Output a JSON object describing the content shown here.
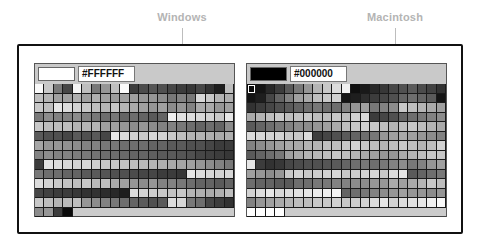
{
  "labels": {
    "left": "Windows",
    "right": "Macintosh"
  },
  "panels": [
    {
      "id": "windows",
      "preview_color": "#FFFFFF",
      "hex_value": "#FFFFFF",
      "rows": [
        [
          250,
          200,
          120,
          70,
          245,
          190,
          120,
          150,
          190,
          250,
          60,
          75,
          85,
          80,
          70,
          60,
          55,
          70,
          50,
          30,
          190
        ],
        [
          190,
          180,
          160,
          160,
          175,
          160,
          175,
          160,
          155,
          160,
          160,
          150,
          150,
          140,
          120,
          130,
          120,
          215,
          200,
          180,
          175
        ],
        [
          200,
          190,
          230,
          220,
          210,
          200,
          190,
          180,
          200,
          180,
          170,
          160,
          150,
          160,
          140,
          150,
          130,
          170,
          170,
          150,
          160
        ],
        [
          120,
          140,
          130,
          130,
          140,
          130,
          120,
          110,
          120,
          100,
          110,
          100,
          90,
          100,
          240,
          225,
          220,
          215,
          210,
          200,
          230
        ],
        [
          200,
          190,
          190,
          190,
          180,
          180,
          180,
          160,
          160,
          150,
          140,
          150,
          140,
          130,
          130,
          120,
          110,
          100,
          110,
          100,
          140
        ],
        [
          90,
          80,
          80,
          70,
          90,
          80,
          90,
          70,
          230,
          220,
          210,
          200,
          215,
          210,
          200,
          190,
          180,
          180,
          175,
          170,
          175
        ],
        [
          165,
          150,
          150,
          145,
          140,
          130,
          130,
          120,
          120,
          110,
          110,
          110,
          100,
          100,
          90,
          90,
          80,
          80,
          70,
          60,
          60
        ],
        [
          130,
          140,
          130,
          130,
          125,
          120,
          115,
          110,
          110,
          105,
          100,
          100,
          95,
          90,
          90,
          85,
          80,
          70,
          65,
          60,
          55
        ],
        [
          60,
          225,
          220,
          215,
          210,
          215,
          205,
          200,
          200,
          195,
          190,
          185,
          180,
          175,
          170,
          165,
          160,
          150,
          140,
          130,
          120
        ],
        [
          120,
          110,
          110,
          100,
          100,
          90,
          90,
          85,
          80,
          80,
          75,
          70,
          70,
          60,
          60,
          55,
          230,
          220,
          215,
          210,
          215
        ],
        [
          220,
          210,
          200,
          195,
          190,
          200,
          185,
          190,
          170,
          160,
          150,
          140,
          150,
          130,
          130,
          120,
          110,
          100,
          100,
          90,
          100
        ],
        [
          70,
          65,
          60,
          60,
          55,
          50,
          50,
          45,
          40,
          30,
          220,
          210,
          205,
          200,
          195,
          200,
          180,
          175,
          170,
          175,
          190
        ],
        [
          200,
          190,
          180,
          185,
          190,
          150,
          140,
          130,
          120,
          110,
          100,
          90,
          80,
          90,
          220,
          215,
          120,
          110,
          70,
          60,
          50
        ],
        [
          140,
          150,
          60,
          10
        ]
      ]
    },
    {
      "id": "macintosh",
      "preview_color": "#000000",
      "hex_value": "#000000",
      "rows": [
        [
          10,
          20,
          40,
          60,
          90,
          120,
          150,
          180,
          200,
          220,
          240,
          15,
          25,
          40,
          55,
          70,
          80,
          90,
          75,
          65,
          50
        ],
        [
          20,
          30,
          70,
          100,
          130,
          160,
          170,
          190,
          200,
          210,
          20,
          30,
          45,
          60,
          70,
          80,
          100,
          110,
          100,
          90,
          20
        ],
        [
          50,
          60,
          70,
          80,
          90,
          100,
          110,
          120,
          110,
          110,
          130,
          150,
          160,
          120,
          130,
          140,
          200,
          190,
          180,
          170,
          160
        ],
        [
          170,
          180,
          190,
          200,
          190,
          195,
          200,
          190,
          190,
          200,
          190,
          210,
          220,
          60,
          70,
          80,
          100,
          110,
          120,
          130,
          140
        ],
        [
          90,
          100,
          110,
          120,
          130,
          140,
          140,
          150,
          160,
          170,
          190,
          200,
          210,
          200,
          190,
          180,
          190,
          200,
          190,
          180,
          170
        ],
        [
          220,
          215,
          210,
          210,
          200,
          200,
          220,
          60,
          70,
          80,
          90,
          100,
          110,
          120,
          150,
          160,
          170,
          160,
          150,
          140,
          130
        ],
        [
          130,
          140,
          150,
          160,
          170,
          170,
          180,
          180,
          190,
          190,
          200,
          210,
          200,
          190,
          180,
          190,
          200,
          190,
          180,
          190,
          210
        ],
        [
          90,
          100,
          110,
          120,
          160,
          170,
          180,
          185,
          190,
          200,
          190,
          180,
          170,
          160,
          150,
          150,
          170,
          180,
          190,
          200,
          200
        ],
        [
          230,
          60,
          50,
          55,
          70,
          75,
          80,
          80,
          85,
          90,
          100,
          110,
          120,
          110,
          120,
          130,
          140,
          120,
          130,
          150,
          160
        ],
        [
          160,
          150,
          140,
          150,
          200,
          210,
          200,
          205,
          210,
          215,
          200,
          205,
          210,
          215,
          200,
          220,
          230,
          90,
          100,
          110,
          120
        ],
        [
          110,
          100,
          100,
          90,
          90,
          110,
          110,
          120,
          120,
          130,
          130,
          140,
          140,
          150,
          150,
          170,
          160,
          170,
          180,
          200,
          190
        ],
        [
          210,
          220,
          230,
          215,
          220,
          225,
          230,
          235,
          240,
          245,
          100,
          110,
          120,
          130,
          140,
          150,
          160,
          150,
          150,
          140,
          150
        ],
        [
          130,
          150,
          160,
          170,
          180,
          190,
          190,
          200,
          200,
          210,
          200,
          205,
          210,
          220,
          230,
          210,
          220,
          225,
          230,
          240,
          250
        ],
        [
          255,
          255,
          255,
          255
        ]
      ]
    }
  ]
}
